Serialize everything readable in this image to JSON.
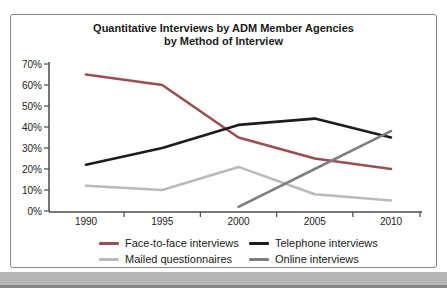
{
  "chart": {
    "title_line1": "Quantitative Interviews by ADM Member Agencies",
    "title_line2": "by Method of Interview",
    "border_color": "#838383"
  },
  "chart_data": {
    "type": "line",
    "title": "Quantitative Interviews by ADM Member Agencies by Method of Interview",
    "categories": [
      "1990",
      "1995",
      "2000",
      "2005",
      "2010"
    ],
    "series": [
      {
        "name": "Face-to-face interviews",
        "color": "#9c4d50",
        "values": [
          65,
          60,
          35,
          25,
          20
        ]
      },
      {
        "name": "Telephone interviews",
        "color": "#1c1c1c",
        "values": [
          22,
          30,
          41,
          44,
          35
        ]
      },
      {
        "name": "Mailed questionnaires",
        "color": "#b9babc",
        "values": [
          12,
          10,
          21,
          8,
          5
        ]
      },
      {
        "name": "Online interviews",
        "color": "#7c7e81",
        "values": [
          null,
          null,
          2,
          20,
          38
        ]
      }
    ],
    "ylim": [
      0,
      70
    ],
    "ytick_step": 10,
    "yticklabels": [
      "0%",
      "10%",
      "20%",
      "30%",
      "40%",
      "50%",
      "60%",
      "70%"
    ],
    "grid": false,
    "legend_position": "bottom",
    "axis_color": "#4a4a4a"
  },
  "page": {
    "background": "#ffffff",
    "bottom_bar_color": "#b6b6b6",
    "bottom_bar_edge_color": "#868686"
  }
}
